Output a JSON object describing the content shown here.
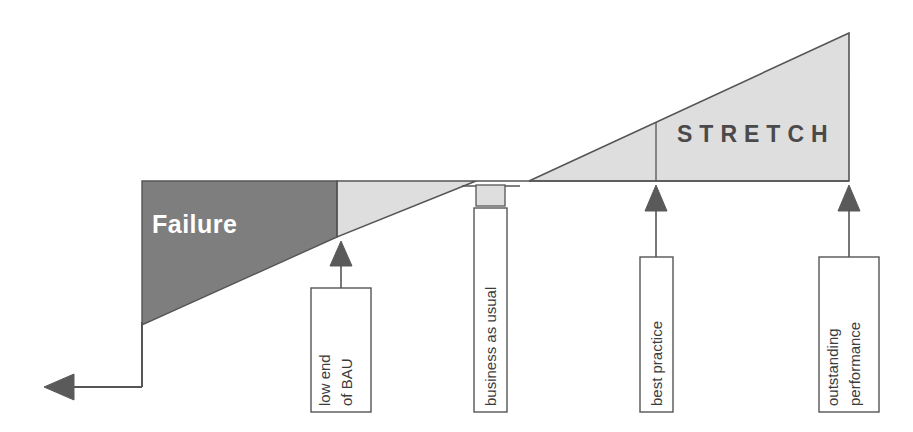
{
  "diagram": {
    "colors": {
      "dark_gray": "#7e7e7e",
      "light_gray": "#dedede",
      "outline": "#555555",
      "arrow_fill": "#5a5a5a",
      "label_white": "#ffffff",
      "label_dark": "#4a4a4a",
      "background": "#ffffff"
    },
    "bands": [
      {
        "id": "failure",
        "label": "Failure",
        "fill": "dark_gray",
        "text_color": "label_white"
      },
      {
        "id": "bau-ramp",
        "label": "",
        "fill": "light_gray",
        "text_color": "label_dark"
      },
      {
        "id": "stretch",
        "label": "STRETCH",
        "fill": "light_gray",
        "text_color": "label_dark"
      }
    ],
    "callouts": [
      {
        "id": "low-end-of-bau",
        "lines": [
          "low end",
          "of BAU"
        ],
        "marker": "arrow-up"
      },
      {
        "id": "business-as-usual",
        "lines": [
          "business as usual"
        ],
        "marker": "capped-box"
      },
      {
        "id": "best-practice",
        "lines": [
          "best practice"
        ],
        "marker": "arrow-up"
      },
      {
        "id": "outstanding-performance",
        "lines": [
          "outstanding",
          "performance"
        ],
        "marker": "arrow-up"
      }
    ],
    "axis": {
      "id": "decreasing-axis",
      "marker": "arrow-left",
      "label": ""
    }
  }
}
